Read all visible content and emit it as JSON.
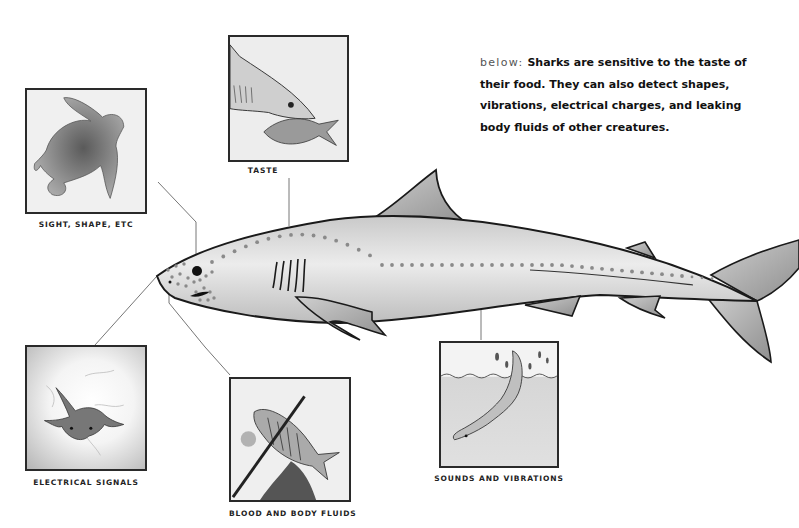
{
  "caption": {
    "lead": "below:",
    "text": "Sharks are sensitive to the taste of their food. They can also detect shapes, vibrations, electrical charges, and leaking body fluids of other creatures."
  },
  "panels": [
    {
      "id": "sight",
      "label": "SIGHT, SHAPE, ETC",
      "subject": "sea turtle silhouette"
    },
    {
      "id": "taste",
      "label": "TASTE",
      "subject": "shark biting a fish"
    },
    {
      "id": "electrical",
      "label": "ELECTRICAL SIGNALS",
      "subject": "ray emitting electrical signals"
    },
    {
      "id": "blood",
      "label": "BLOOD AND BODY FLUIDS",
      "subject": "speared fish leaking fluids"
    },
    {
      "id": "sounds",
      "label": "SOUNDS AND VIBRATIONS",
      "subject": "shark splashing at water surface"
    }
  ],
  "main_figure": {
    "subject": "shark side view with lateral line sensory pores",
    "colors": {
      "body": "#d4d4d4",
      "fin": "#a9a9a9",
      "outline": "#1a1a1a",
      "pores": "#8a8a8a",
      "leader": "#777777"
    }
  }
}
